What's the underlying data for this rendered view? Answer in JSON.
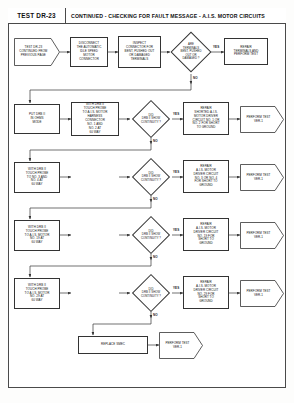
{
  "header": {
    "test_id": "TEST DR-23",
    "title": "CONTINUED - CHECKING FOR FAULT MESSAGE - A.I.S. MOTOR CIRCUITS"
  },
  "diagram": {
    "type": "flowchart",
    "orientation": "left-to-right rows, top-to-bottom flow",
    "nodes": [
      {
        "id": "n1",
        "shape": "startflag",
        "text": "TEST DR-23\nCONTINUED FROM\nPREVIOUS PAGE"
      },
      {
        "id": "n2",
        "shape": "process",
        "text": "DISCONNECT\nTHE AUTOMATIC\nIDLE SPEED\nMOTOR\nCONNECTOR"
      },
      {
        "id": "n3",
        "shape": "process",
        "text": "INSPECT\nCONNECTOR FOR\nBENT, PUSHED OUT\nOR DAMAGED\nTERMINALS"
      },
      {
        "id": "n4",
        "shape": "decision",
        "text": "ARE\nTERMINALS\nBENT, PUSHED\nOUT OR\nDAMAGED ?"
      },
      {
        "id": "n5",
        "shape": "process",
        "text": "REPAIR\nTERMINALS AND\nPERFORM TEST"
      },
      {
        "id": "n6",
        "shape": "process",
        "text": "PUT DRB II\nIN OHMS\nMODE"
      },
      {
        "id": "n7",
        "shape": "process",
        "text": "WITH DRB II\nTOUCH PROBE\nTO A.I.S. MOTOR\nHARNESS\nCONNECTOR\nNO. 1 AND\nNO. 2 AT\n60 WAY"
      },
      {
        "id": "n8",
        "shape": "decision",
        "text": "DID\nDRB II SHOW\nCONTINUITY ?"
      },
      {
        "id": "n9",
        "shape": "process",
        "text": "REPAIR\nSHORTED A.I.S.\nMOTOR DRIVER\nCIRCUIT NO. 1 OR\nNO. 2 FOR SHORT\nTO GROUND"
      },
      {
        "id": "n10",
        "shape": "terminator",
        "text": "PERFORM TEST\nVER-1"
      },
      {
        "id": "n11",
        "shape": "process",
        "text": "WITH DRB II\nTOUCH PROBE\nTO NO. 3 AND\nNO. 4 AT\n60 WAY"
      },
      {
        "id": "n12",
        "shape": "decision",
        "text": "DID\nDRB II SHOW\nCONTINUITY ?"
      },
      {
        "id": "n13",
        "shape": "process",
        "text": "REPAIR\nA.I.S. MOTOR\nDRIVER CIRCUIT\nNO. 3 OR NO. 4\nFOR SHORT TO\nGROUND"
      },
      {
        "id": "n14",
        "shape": "terminator",
        "text": "PERFORM TEST\nVER-1"
      },
      {
        "id": "n15",
        "shape": "process",
        "text": "WITH DRB II\nTOUCH PROBE\nTO A.I.S. MOTOR\nNO. 19 AT\n60 WAY"
      },
      {
        "id": "n16",
        "shape": "decision",
        "text": "DID\nDRB II SHOW\nCONTINUITY ?"
      },
      {
        "id": "n17",
        "shape": "process",
        "text": "REPAIR\nA.I.S. MOTOR\nDRIVER CIRCUIT\nNO. 19 FOR\nSHORT TO\nGROUND"
      },
      {
        "id": "n18",
        "shape": "terminator",
        "text": "PERFORM TEST\nVER-1"
      },
      {
        "id": "n19",
        "shape": "process",
        "text": "WITH DRB II\nTOUCH PROBE\nTO A.I.S. MOTOR\nNO. 29 AT\n60 WAY"
      },
      {
        "id": "n20",
        "shape": "decision",
        "text": "DID\nDRB II SHOW\nCONTINUITY ?"
      },
      {
        "id": "n21",
        "shape": "process",
        "text": "REPAIR\nA.I.S. MOTOR\nDRIVER CIRCUIT\nNO. 29 FOR\nSHORT TO\nGROUND"
      },
      {
        "id": "n22",
        "shape": "terminator",
        "text": "PERFORM TEST\nVER-1"
      },
      {
        "id": "n23",
        "shape": "process",
        "text": "REPLACE SMEC"
      },
      {
        "id": "n24",
        "shape": "terminator",
        "text": "PERFORM TEST\nVER-1"
      }
    ],
    "branch_labels": {
      "yes": "YES",
      "no": "NO"
    },
    "edges": [
      {
        "from": "n1",
        "to": "n2",
        "label": ""
      },
      {
        "from": "n2",
        "to": "n3",
        "label": ""
      },
      {
        "from": "n3",
        "to": "n4",
        "label": ""
      },
      {
        "from": "n4",
        "to": "n5",
        "label": "YES"
      },
      {
        "from": "n4",
        "to": "n6",
        "label": "NO"
      },
      {
        "from": "n6",
        "to": "n7",
        "label": ""
      },
      {
        "from": "n7",
        "to": "n8",
        "label": ""
      },
      {
        "from": "n8",
        "to": "n9",
        "label": "YES"
      },
      {
        "from": "n9",
        "to": "n10",
        "label": ""
      },
      {
        "from": "n8",
        "to": "n11",
        "label": "NO"
      },
      {
        "from": "n11",
        "to": "n12",
        "label": ""
      },
      {
        "from": "n12",
        "to": "n13",
        "label": "YES"
      },
      {
        "from": "n13",
        "to": "n14",
        "label": ""
      },
      {
        "from": "n12",
        "to": "n15",
        "label": "NO"
      },
      {
        "from": "n15",
        "to": "n16",
        "label": ""
      },
      {
        "from": "n16",
        "to": "n17",
        "label": "YES"
      },
      {
        "from": "n17",
        "to": "n18",
        "label": ""
      },
      {
        "from": "n16",
        "to": "n19",
        "label": "NO"
      },
      {
        "from": "n19",
        "to": "n20",
        "label": ""
      },
      {
        "from": "n20",
        "to": "n21",
        "label": "YES"
      },
      {
        "from": "n21",
        "to": "n22",
        "label": ""
      },
      {
        "from": "n20",
        "to": "n23",
        "label": "NO"
      },
      {
        "from": "n23",
        "to": "n24",
        "label": ""
      }
    ]
  }
}
